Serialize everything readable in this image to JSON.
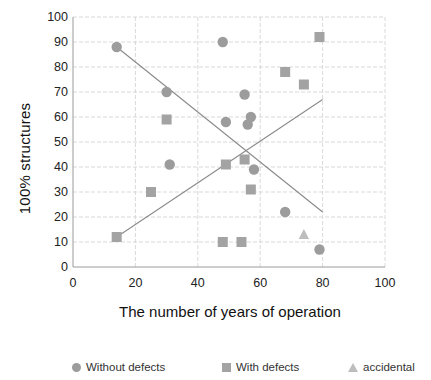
{
  "chart_data": {
    "type": "scatter",
    "title": "",
    "xlabel": "The number of years of operation",
    "ylabel": "100% structures",
    "xlim": [
      0,
      100
    ],
    "ylim": [
      0,
      100
    ],
    "xticks": [
      0,
      20,
      40,
      60,
      80,
      100
    ],
    "yticks": [
      0,
      10,
      20,
      30,
      40,
      50,
      60,
      70,
      80,
      90,
      100
    ],
    "grid": true,
    "legend_position": "bottom",
    "series": [
      {
        "name": "Without defects",
        "marker": "circle",
        "color": "#9c9c9c",
        "points": [
          {
            "x": 14,
            "y": 88
          },
          {
            "x": 30,
            "y": 70
          },
          {
            "x": 31,
            "y": 41
          },
          {
            "x": 48,
            "y": 90
          },
          {
            "x": 49,
            "y": 58
          },
          {
            "x": 55,
            "y": 69
          },
          {
            "x": 56,
            "y": 57
          },
          {
            "x": 57,
            "y": 60
          },
          {
            "x": 58,
            "y": 39
          },
          {
            "x": 68,
            "y": 22
          },
          {
            "x": 79,
            "y": 7
          }
        ]
      },
      {
        "name": "With defects",
        "marker": "square",
        "color": "#a3a3a3",
        "points": [
          {
            "x": 14,
            "y": 12
          },
          {
            "x": 25,
            "y": 30
          },
          {
            "x": 30,
            "y": 59
          },
          {
            "x": 48,
            "y": 10
          },
          {
            "x": 49,
            "y": 41
          },
          {
            "x": 54,
            "y": 10
          },
          {
            "x": 55,
            "y": 43
          },
          {
            "x": 57,
            "y": 31
          },
          {
            "x": 68,
            "y": 78
          },
          {
            "x": 74,
            "y": 73
          },
          {
            "x": 79,
            "y": 92
          }
        ]
      },
      {
        "name": "accidental",
        "marker": "triangle",
        "color": "#bdbdbd",
        "points": [
          {
            "x": 74,
            "y": 13
          }
        ]
      }
    ],
    "trendlines": [
      {
        "name": "declining-trendline",
        "x0": 14,
        "y0": 88,
        "x1": 80,
        "y1": 22,
        "color": "#8a8a8a"
      },
      {
        "name": "rising-trendline",
        "x0": 14,
        "y0": 12,
        "x1": 80,
        "y1": 67,
        "color": "#8a8a8a"
      }
    ]
  },
  "axes": {
    "ylabel": "100% structures",
    "xlabel": "The number of years of operation",
    "ytick_labels": [
      "100",
      "90",
      "80",
      "70",
      "60",
      "50",
      "40",
      "30",
      "20",
      "10",
      "0"
    ],
    "xtick_labels": [
      "0",
      "20",
      "40",
      "60",
      "80",
      "100"
    ]
  },
  "legend": {
    "items": [
      {
        "label": "Without defects",
        "icon": "circle-marker-icon"
      },
      {
        "label": "With defects",
        "icon": "square-marker-icon"
      },
      {
        "label": "accidental",
        "icon": "triangle-marker-icon"
      }
    ]
  }
}
